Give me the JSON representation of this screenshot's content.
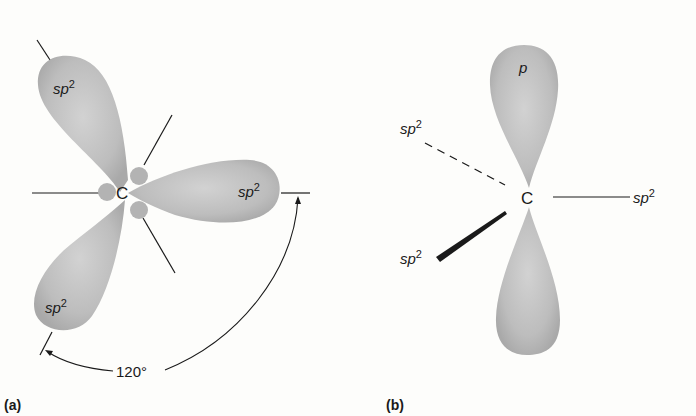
{
  "figure": {
    "panel_a": {
      "label": "(a)",
      "center_atom": "C",
      "lobes": [
        {
          "name": "sp",
          "superscript": "2",
          "direction": "upper-left"
        },
        {
          "name": "sp",
          "superscript": "2",
          "direction": "right"
        },
        {
          "name": "sp",
          "superscript": "2",
          "direction": "lower-left"
        }
      ],
      "angle_label": "120°"
    },
    "panel_b": {
      "label": "(b)",
      "center_atom": "C",
      "p_orbital_label": "p",
      "bonds": [
        {
          "name": "sp",
          "superscript": "2",
          "style": "dashed",
          "direction": "upper-left"
        },
        {
          "name": "sp",
          "superscript": "2",
          "style": "solid",
          "direction": "right"
        },
        {
          "name": "sp",
          "superscript": "2",
          "style": "wedge",
          "direction": "lower-left"
        }
      ]
    },
    "colors": {
      "lobe_fill": "#b9b9b9",
      "lobe_light": "#d6d6d6",
      "line": "#1a1a1a"
    }
  }
}
